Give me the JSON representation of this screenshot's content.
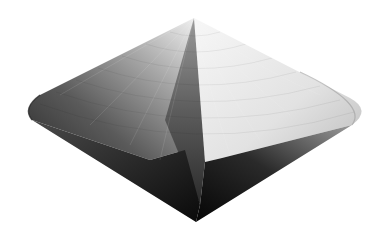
{
  "image": {
    "subject": "shaded 3D double cone (bicone) with faceted grid",
    "width": 384,
    "height": 239,
    "background": "#ffffff"
  },
  "shape": {
    "apex_top": [
      194,
      18
    ],
    "apex_bottom": [
      196,
      222
    ],
    "rim_left": [
      27,
      112
    ],
    "rim_right": [
      363,
      112
    ],
    "fold_bottom": [
      205,
      162
    ],
    "shelf_right": [
      222,
      158
    ],
    "colors": {
      "left_dark": "#3c3c3c",
      "left_mid": "#7a7a7a",
      "left_light": "#c8c8c8",
      "right_light": "#f2f2f2",
      "right_mid": "#dcdcdc",
      "right_rim": "#b4b4b4",
      "bottom_dark": "#0e0e0e",
      "fold_dark": "#4a4a4a"
    },
    "grid_rings": 9,
    "grid_spokes": 14
  }
}
